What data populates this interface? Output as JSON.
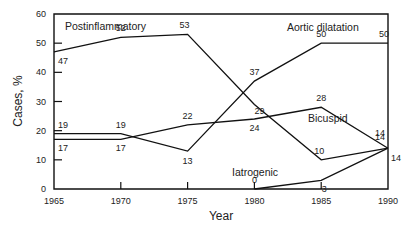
{
  "chart_data": {
    "type": "line",
    "title": "",
    "xlabel": "Year",
    "ylabel": "Cases, %",
    "x": [
      1965,
      1970,
      1975,
      1980,
      1985,
      1990
    ],
    "xlim": [
      1965,
      1990
    ],
    "ylim": [
      0,
      60
    ],
    "xticks": [
      "1965",
      "1970",
      "1975",
      "1980",
      "1985",
      "1990"
    ],
    "yticks": [
      "0",
      "10",
      "20",
      "30",
      "40",
      "50",
      "60"
    ],
    "grid": false,
    "legend": "inline labels",
    "series": [
      {
        "name": "Postinflammatory",
        "values": [
          47,
          52,
          53,
          29,
          10,
          14
        ],
        "labels": [
          "47",
          "52",
          "53",
          "29",
          "10",
          "14"
        ]
      },
      {
        "name": "Aortic dilatation",
        "values": [
          19,
          19,
          13,
          37,
          50,
          50
        ],
        "labels": [
          "19",
          "19",
          "13",
          "37",
          "50",
          "50"
        ]
      },
      {
        "name": "Bicuspid",
        "values": [
          17,
          17,
          22,
          24,
          28,
          14
        ],
        "labels": [
          "17",
          "17",
          "22",
          "24",
          "28",
          "14"
        ]
      },
      {
        "name": "Iatrogenic",
        "values": [
          null,
          null,
          null,
          0,
          3,
          14
        ],
        "labels": [
          "",
          "",
          "",
          "0",
          "3",
          "14"
        ]
      }
    ]
  }
}
